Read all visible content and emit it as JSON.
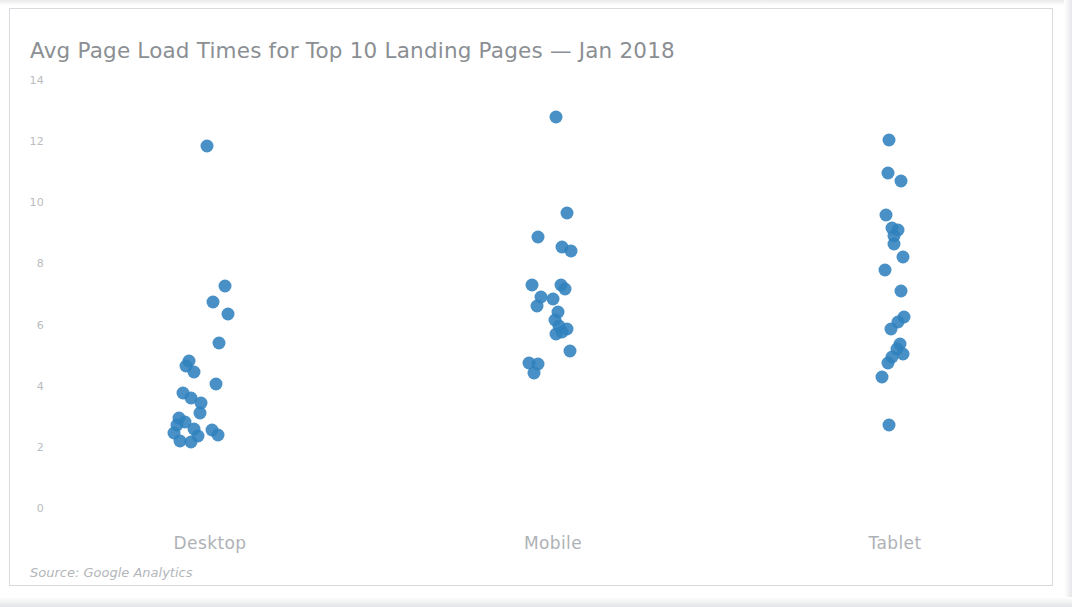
{
  "chart_data": {
    "type": "scatter",
    "title": "Avg Page Load Times for Top 10 Landing Pages — Jan 2018",
    "subtitle": "",
    "xlabel": "",
    "ylabel": "",
    "source_note": "Source: Google Analytics",
    "grid": false,
    "legend": "none",
    "accent_color": "#2f81bd",
    "text_color": "#8b8f93",
    "tick_color": "#b9bcc0",
    "categories": [
      "Desktop",
      "Mobile",
      "Tablet"
    ],
    "ylim": [
      0,
      14
    ],
    "yticks": [
      0,
      2,
      4,
      6,
      8,
      10,
      12,
      14
    ],
    "ytick_labels": [
      "0",
      "2",
      "4",
      "6",
      "8",
      "10",
      "12",
      "14"
    ],
    "series": [
      {
        "name": "Desktop",
        "category_index": 0,
        "points": [
          {
            "jitter": -0.02,
            "value": 11.85
          },
          {
            "jitter": 0.1,
            "value": 7.25
          },
          {
            "jitter": 0.02,
            "value": 6.75
          },
          {
            "jitter": 0.12,
            "value": 6.35
          },
          {
            "jitter": 0.06,
            "value": 5.4
          },
          {
            "jitter": -0.14,
            "value": 4.8
          },
          {
            "jitter": -0.16,
            "value": 4.65
          },
          {
            "jitter": -0.11,
            "value": 4.45
          },
          {
            "jitter": 0.04,
            "value": 4.05
          },
          {
            "jitter": -0.18,
            "value": 3.75
          },
          {
            "jitter": -0.13,
            "value": 3.6
          },
          {
            "jitter": -0.06,
            "value": 3.45
          },
          {
            "jitter": -0.07,
            "value": 3.1
          },
          {
            "jitter": -0.21,
            "value": 2.95
          },
          {
            "jitter": -0.17,
            "value": 2.8
          },
          {
            "jitter": -0.22,
            "value": 2.7
          },
          {
            "jitter": -0.11,
            "value": 2.6
          },
          {
            "jitter": -0.24,
            "value": 2.45
          },
          {
            "jitter": 0.01,
            "value": 2.55
          },
          {
            "jitter": -0.08,
            "value": 2.35
          },
          {
            "jitter": -0.2,
            "value": 2.2
          },
          {
            "jitter": -0.13,
            "value": 2.15
          },
          {
            "jitter": 0.05,
            "value": 2.4
          }
        ]
      },
      {
        "name": "Mobile",
        "category_index": 1,
        "points": [
          {
            "jitter": 0.02,
            "value": 12.8
          },
          {
            "jitter": 0.09,
            "value": 9.65
          },
          {
            "jitter": -0.1,
            "value": 8.85
          },
          {
            "jitter": 0.06,
            "value": 8.55
          },
          {
            "jitter": 0.12,
            "value": 8.4
          },
          {
            "jitter": -0.14,
            "value": 7.3
          },
          {
            "jitter": 0.05,
            "value": 7.3
          },
          {
            "jitter": 0.08,
            "value": 7.15
          },
          {
            "jitter": -0.08,
            "value": 6.9
          },
          {
            "jitter": -0.11,
            "value": 6.6
          },
          {
            "jitter": 0.0,
            "value": 6.85
          },
          {
            "jitter": 0.03,
            "value": 6.4
          },
          {
            "jitter": 0.01,
            "value": 6.15
          },
          {
            "jitter": 0.04,
            "value": 5.95
          },
          {
            "jitter": 0.09,
            "value": 5.85
          },
          {
            "jitter": 0.06,
            "value": 5.75
          },
          {
            "jitter": 0.02,
            "value": 5.7
          },
          {
            "jitter": 0.11,
            "value": 5.15
          },
          {
            "jitter": -0.16,
            "value": 4.75
          },
          {
            "jitter": -0.1,
            "value": 4.7
          },
          {
            "jitter": -0.13,
            "value": 4.4
          }
        ]
      },
      {
        "name": "Tablet",
        "category_index": 2,
        "points": [
          {
            "jitter": -0.04,
            "value": 12.05
          },
          {
            "jitter": -0.05,
            "value": 10.95
          },
          {
            "jitter": 0.04,
            "value": 10.7
          },
          {
            "jitter": -0.06,
            "value": 9.6
          },
          {
            "jitter": -0.02,
            "value": 9.15
          },
          {
            "jitter": 0.02,
            "value": 9.1
          },
          {
            "jitter": -0.01,
            "value": 8.9
          },
          {
            "jitter": -0.01,
            "value": 8.65
          },
          {
            "jitter": 0.05,
            "value": 8.2
          },
          {
            "jitter": -0.07,
            "value": 7.8
          },
          {
            "jitter": 0.04,
            "value": 7.1
          },
          {
            "jitter": 0.06,
            "value": 6.25
          },
          {
            "jitter": 0.02,
            "value": 6.1
          },
          {
            "jitter": -0.03,
            "value": 5.85
          },
          {
            "jitter": 0.03,
            "value": 5.35
          },
          {
            "jitter": 0.01,
            "value": 5.2
          },
          {
            "jitter": 0.05,
            "value": 5.05
          },
          {
            "jitter": -0.02,
            "value": 4.95
          },
          {
            "jitter": -0.05,
            "value": 4.75
          },
          {
            "jitter": -0.09,
            "value": 4.3
          },
          {
            "jitter": -0.04,
            "value": 2.7
          }
        ]
      }
    ]
  },
  "plot_geometry": {
    "y_pixel_at_zero": 508,
    "y_pixel_at_max": 80,
    "category_x_pixels": [
      210,
      553,
      895
    ],
    "category_spread_pixels": 150,
    "dot_diameter": 13
  }
}
